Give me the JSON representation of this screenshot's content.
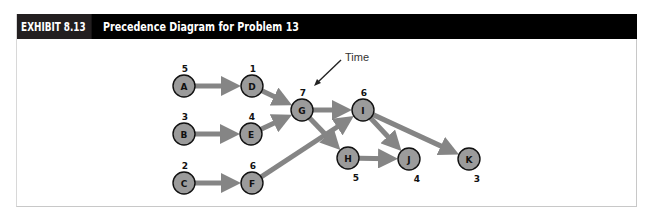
{
  "header": {
    "exhibit_number": "EXHIBIT 8.13",
    "title": "Precedence Diagram for Problem 13"
  },
  "annotation": {
    "label": "Time",
    "points_to": "G"
  },
  "colors": {
    "node_fill": "#9b9b9b",
    "node_stroke": "#111111",
    "edge": "#858585",
    "header_bg": "#000000",
    "header_num_bg": "#231f20"
  },
  "nodes": [
    {
      "id": "A",
      "time": "5",
      "x": 184,
      "y": 86,
      "label_pos": "above"
    },
    {
      "id": "B",
      "time": "3",
      "x": 184,
      "y": 134,
      "label_pos": "above"
    },
    {
      "id": "C",
      "time": "2",
      "x": 184,
      "y": 183,
      "label_pos": "above"
    },
    {
      "id": "D",
      "time": "1",
      "x": 252,
      "y": 86,
      "label_pos": "above"
    },
    {
      "id": "E",
      "time": "4",
      "x": 251,
      "y": 134,
      "label_pos": "above"
    },
    {
      "id": "F",
      "time": "6",
      "x": 252,
      "y": 183,
      "label_pos": "above"
    },
    {
      "id": "G",
      "time": "7",
      "x": 302,
      "y": 110,
      "label_pos": "above"
    },
    {
      "id": "H",
      "time": "5",
      "x": 348,
      "y": 158,
      "label_pos": "below"
    },
    {
      "id": "I",
      "time": "6",
      "x": 363,
      "y": 110,
      "label_pos": "above"
    },
    {
      "id": "J",
      "time": "4",
      "x": 409,
      "y": 159,
      "label_pos": "below"
    },
    {
      "id": "K",
      "time": "3",
      "x": 469,
      "y": 159,
      "label_pos": "below"
    }
  ],
  "edges": [
    {
      "from": "A",
      "to": "D"
    },
    {
      "from": "B",
      "to": "E"
    },
    {
      "from": "C",
      "to": "F"
    },
    {
      "from": "D",
      "to": "G"
    },
    {
      "from": "E",
      "to": "G"
    },
    {
      "from": "F",
      "to": "I"
    },
    {
      "from": "G",
      "to": "I"
    },
    {
      "from": "G",
      "to": "H"
    },
    {
      "from": "H",
      "to": "J"
    },
    {
      "from": "I",
      "to": "J"
    },
    {
      "from": "I",
      "to": "K"
    }
  ]
}
